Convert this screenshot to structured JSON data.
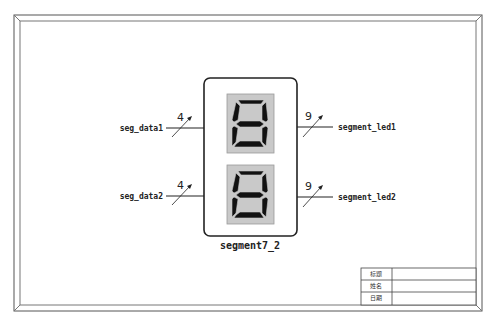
{
  "component": {
    "name": "segment7_2",
    "displays": [
      {
        "id": "digit1",
        "glyph": "8"
      },
      {
        "id": "digit2",
        "glyph": "8"
      }
    ]
  },
  "ports": {
    "inputs": [
      {
        "name": "seg_data1",
        "width": "4"
      },
      {
        "name": "seg_data2",
        "width": "4"
      }
    ],
    "outputs": [
      {
        "name": "segment_led1",
        "width": "9"
      },
      {
        "name": "segment_led2",
        "width": "9"
      }
    ]
  },
  "title_block": {
    "rows": [
      {
        "label": "标题",
        "value": ""
      },
      {
        "label": "姓名",
        "value": ""
      },
      {
        "label": "日期",
        "value": ""
      }
    ]
  },
  "colors": {
    "frame": "#555555",
    "display_bg": "#c8c8c8",
    "segment_on": "#111111",
    "line": "#222222"
  }
}
